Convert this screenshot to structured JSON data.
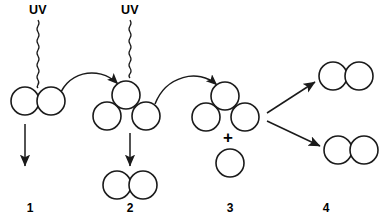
{
  "figure": {
    "type": "diagram",
    "background_color": "#ffffff",
    "stroke_color": "#1a1a1a",
    "width": 392,
    "height": 223
  },
  "labels": {
    "uv_1": "UV",
    "uv_2": "UV",
    "plus": "+",
    "step_1": "1",
    "step_2": "2",
    "step_3": "3",
    "step_4": "4"
  },
  "groups": [
    {
      "id": "group-1",
      "number": "1",
      "number_x": 30,
      "number_y": 212,
      "description": "two bonded spheres receiving UV photon",
      "circles": [
        {
          "cx": 25,
          "cy": 101,
          "r": 14
        },
        {
          "cx": 51,
          "cy": 101,
          "r": 14
        }
      ],
      "uv": {
        "label": "UV",
        "text_x": 38,
        "text_y": 14,
        "squiggle_x": 38,
        "squiggle_top": 20,
        "squiggle_bottom": 88
      },
      "down_arrow": {
        "x": 25,
        "y1": 124,
        "y2": 168
      }
    },
    {
      "id": "group-2",
      "number": "2",
      "number_x": 130,
      "number_y": 212,
      "description": "three sphere cluster receiving second UV photon",
      "circles": [
        {
          "cx": 126,
          "cy": 95,
          "r": 14
        },
        {
          "cx": 107,
          "cy": 116,
          "r": 14
        },
        {
          "cx": 146,
          "cy": 116,
          "r": 14
        }
      ],
      "uv": {
        "label": "UV",
        "text_x": 130,
        "text_y": 14,
        "squiggle_x": 130,
        "squiggle_top": 20,
        "squiggle_bottom": 82
      },
      "down_arrow": {
        "x": 130,
        "y1": 133,
        "y2": 168
      },
      "product": {
        "circles": [
          {
            "cx": 117,
            "cy": 185,
            "r": 14
          },
          {
            "cx": 143,
            "cy": 185,
            "r": 14
          }
        ]
      }
    },
    {
      "id": "group-3",
      "number": "3",
      "number_x": 230,
      "number_y": 212,
      "description": "three sphere cluster plus free sphere",
      "circles": [
        {
          "cx": 225,
          "cy": 96,
          "r": 14
        },
        {
          "cx": 206,
          "cy": 117,
          "r": 14
        },
        {
          "cx": 245,
          "cy": 117,
          "r": 14
        }
      ],
      "plus": {
        "x": 228,
        "y": 141
      },
      "free_circle": {
        "cx": 230,
        "cy": 163,
        "r": 14
      }
    },
    {
      "id": "group-4",
      "number": "4",
      "number_x": 326,
      "number_y": 212,
      "description": "two separate bonded sphere pairs",
      "pair_top": [
        {
          "cx": 333,
          "cy": 76,
          "r": 14
        },
        {
          "cx": 359,
          "cy": 76,
          "r": 14
        }
      ],
      "pair_bottom": [
        {
          "cx": 338,
          "cy": 150,
          "r": 14
        },
        {
          "cx": 364,
          "cy": 150,
          "r": 14
        }
      ]
    }
  ],
  "connectors": [
    {
      "id": "curve-1-to-2",
      "from": "group-1",
      "to": "group-2",
      "kind": "curved-arrow"
    },
    {
      "id": "curve-2-to-3",
      "from": "group-2",
      "to": "group-3",
      "kind": "curved-arrow"
    },
    {
      "id": "branch-upper",
      "from": "group-3",
      "to": "group-4-top",
      "kind": "straight-arrow"
    },
    {
      "id": "branch-lower",
      "from": "group-3",
      "to": "group-4-bottom",
      "kind": "straight-arrow"
    }
  ]
}
